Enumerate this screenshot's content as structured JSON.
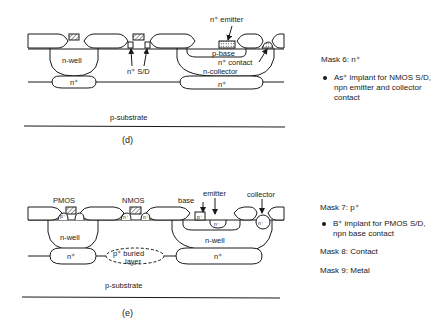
{
  "panel_d": {
    "caption": "(d)",
    "labels": {
      "n_well": "n-well",
      "n_plus_left": "n⁺",
      "n_plus_sd": "n⁺ S/D",
      "n_plus_emitter": "n⁺ emitter",
      "p_base": "p-base",
      "n_plus_contact": "n⁺ contact",
      "n_collector": "n-collector",
      "n_plus_right": "n⁺",
      "p_substrate": "p-substrate"
    },
    "side": {
      "mask_title": "Mask 6: n⁺",
      "bullet": "As⁺ implant for NMOS S/D, npn emitter and collector contact"
    }
  },
  "panel_e": {
    "caption": "(e)",
    "labels": {
      "pmos": "PMOS",
      "nmos": "NMOS",
      "base": "base",
      "emitter": "emitter",
      "collector": "collector",
      "p_small": "p⁺",
      "n_small": "n⁺",
      "n_well_left": "n-well",
      "n_well_right": "n-well",
      "n_plus_left": "n⁺",
      "n_plus_right": "n⁺",
      "buried_layer_1": "p⁺ buried",
      "buried_layer_2": "layer",
      "p_substrate": "p-substrate"
    },
    "side": {
      "mask7_title": "Mask 7: p⁺",
      "bullet": "B⁺ implant for PMOS S/D, npn base contact",
      "mask8": "Mask 8: Contact",
      "mask9": "Mask 9: Metal"
    }
  },
  "colors": {
    "ink": "#1a1a1a",
    "background": "#ffffff"
  }
}
